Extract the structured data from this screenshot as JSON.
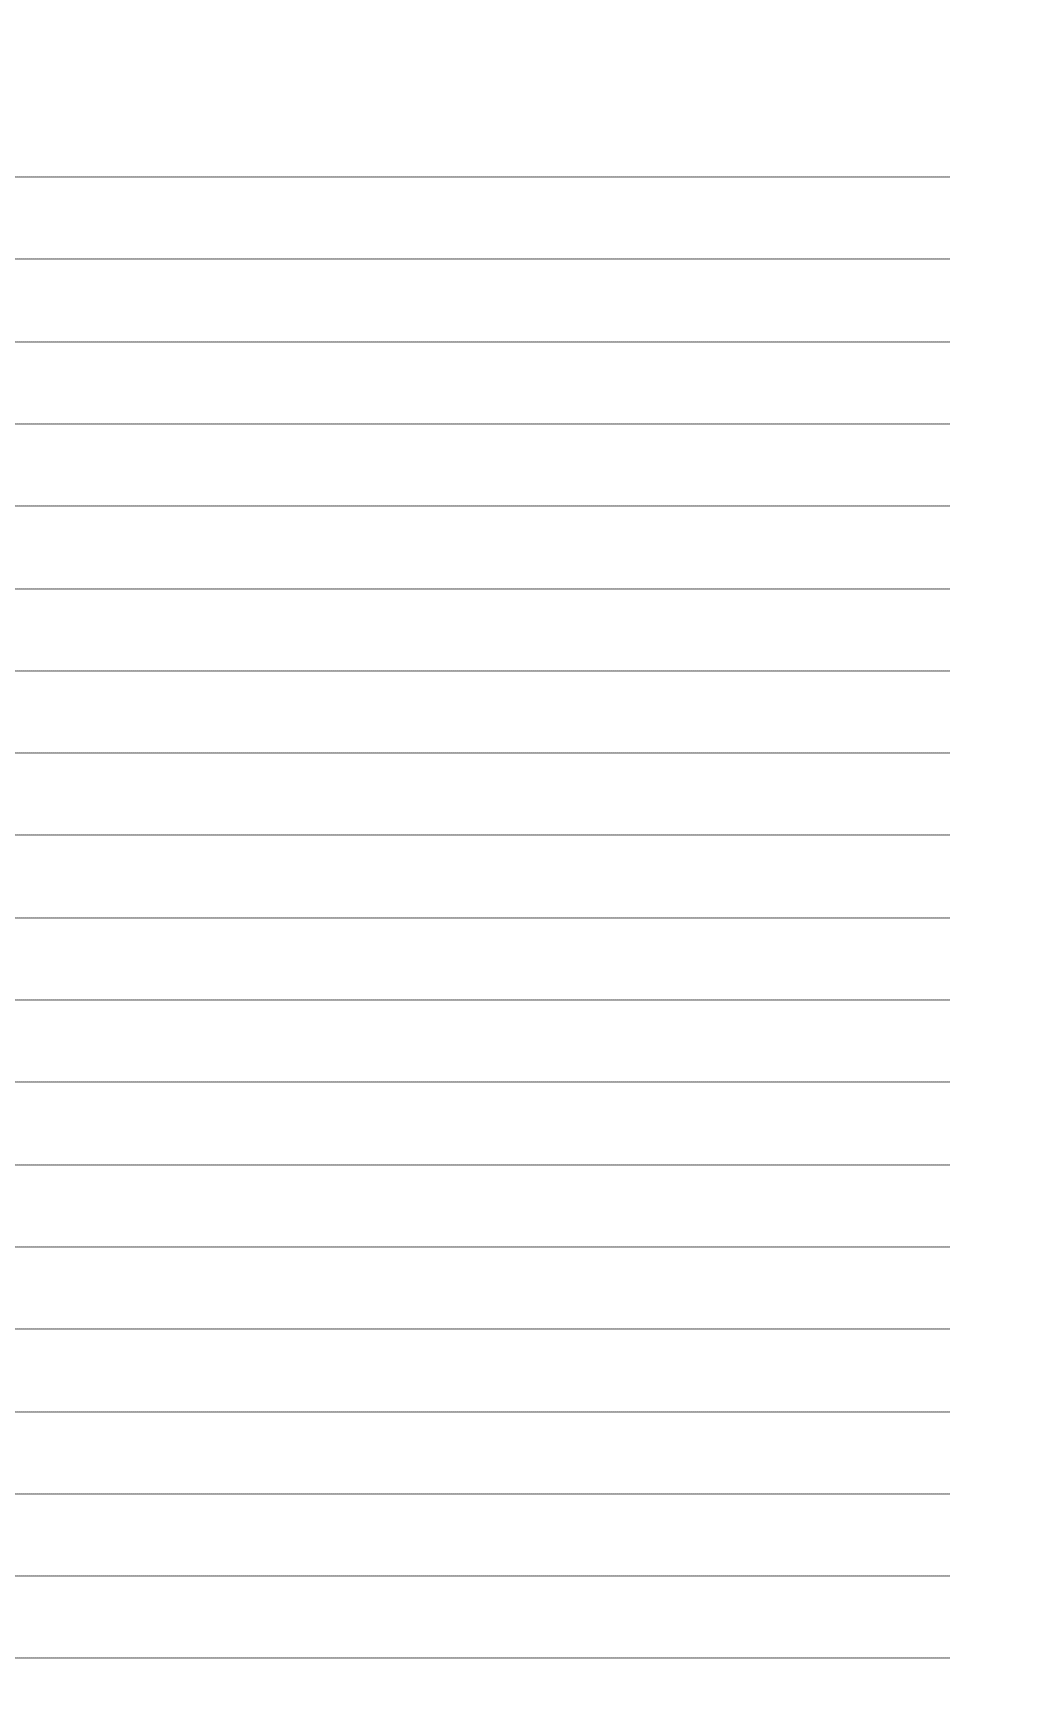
{
  "document": {
    "type": "lined-paper",
    "line_count": 19,
    "first_line_y": 176,
    "line_spacing": 82.3,
    "line_left": 15,
    "line_width": 935,
    "line_color": "#9a9a9a",
    "background_color": "#ffffff"
  }
}
